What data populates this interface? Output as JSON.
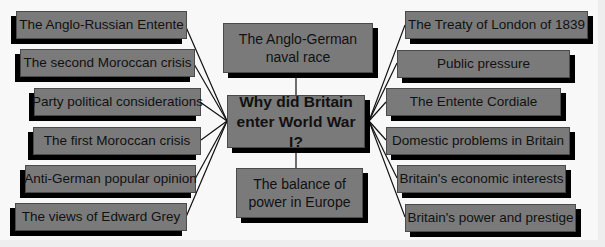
{
  "diagram": {
    "central_question": "Why did Britain enter World War I?",
    "center_top": "The Anglo-German naval race",
    "center_bottom": "The balance of power in Europe",
    "left_factors": [
      "The Anglo-Russian Entente",
      "The second Moroccan crisis",
      "Party political considerations",
      "The first Moroccan crisis",
      "Anti-German popular opinion",
      "The views of Edward Grey"
    ],
    "right_factors": [
      "The Treaty of London of 1839",
      "Public pressure",
      "The Entente Cordiale",
      "Domestic problems in Britain",
      "Britain's economic interests",
      "Britain's power and prestige"
    ]
  },
  "colors": {
    "box_fill": "#7a7a7a",
    "shadow": "#000000",
    "background": "#f8f8f8",
    "line": "#111111"
  }
}
